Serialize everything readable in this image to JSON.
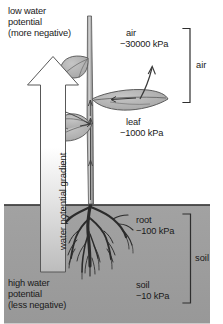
{
  "figure": {
    "top_label": "low water\npotential\n(more negative)",
    "bottom_label": "high water\npotential\n(less negative)",
    "arrow_label": "water potential gradient",
    "annotations": {
      "air": {
        "name": "air",
        "value": "−30000 kPa"
      },
      "leaf": {
        "name": "leaf",
        "value": "−1000 kPa"
      },
      "root": {
        "name": "root",
        "value": "−100 kPa"
      },
      "soil": {
        "name": "soil",
        "value": "−10 kPa"
      }
    },
    "brackets": {
      "air": "air",
      "soil": "soil"
    },
    "colors": {
      "soil_fill": "#9d9d9d",
      "soil_line": "#3a3a3a",
      "leaf_fill": "#b5b5b5",
      "outline": "#4a4a4a",
      "arrow_top": "#ffffff",
      "arrow_bottom": "#bdbdbd",
      "text": "#1a1a1a"
    }
  }
}
